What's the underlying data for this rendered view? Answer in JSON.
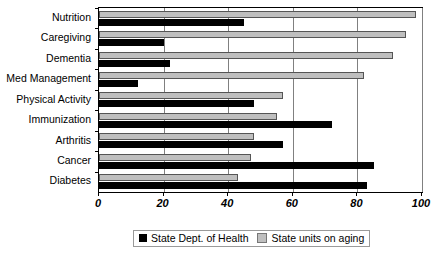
{
  "chart_data": {
    "type": "bar",
    "orientation": "horizontal",
    "title": "",
    "xlabel": "",
    "ylabel": "",
    "xlim": [
      0,
      100
    ],
    "xticks": [
      0,
      20,
      40,
      60,
      80,
      100
    ],
    "grid": true,
    "legend_position": "bottom",
    "categories": [
      "Nutrition",
      "Caregiving",
      "Dementia",
      "Med Management",
      "Physical Activity",
      "Immunization",
      "Arthritis",
      "Cancer",
      "Diabetes"
    ],
    "series": [
      {
        "name": "State Dept. of Health",
        "color": "#000000",
        "values": [
          45,
          20,
          22,
          12,
          48,
          72,
          57,
          85,
          83
        ]
      },
      {
        "name": "State units on aging",
        "color": "#BFBFBF",
        "values": [
          98,
          95,
          91,
          82,
          57,
          55,
          48,
          47,
          43
        ]
      }
    ]
  }
}
